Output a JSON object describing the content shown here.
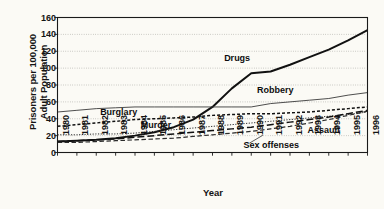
{
  "chart_data": {
    "type": "line",
    "title": "",
    "xlabel": "Year",
    "ylabel_line1": "Prisoners per 100,000",
    "ylabel_line2": "Adult Population",
    "grid": "horizontal-dotted",
    "legend_position": "inline-annotations",
    "xlim": [
      1980,
      1996
    ],
    "ylim": [
      0,
      160
    ],
    "yticks": [
      160,
      140,
      120,
      100,
      80,
      60,
      40,
      20,
      0
    ],
    "categories": [
      1980,
      1981,
      1982,
      1983,
      1984,
      1985,
      1986,
      1987,
      1988,
      1989,
      1990,
      1991,
      1992,
      1993,
      1994,
      1995,
      1996
    ],
    "xticklabels": [
      "1980",
      "1981",
      "1982",
      "1983",
      "1984",
      "1985",
      "1986",
      "1987",
      "1988",
      "1989",
      "1990",
      "1991",
      "1992",
      "1993",
      "1994",
      "1995",
      "1996"
    ],
    "series": [
      {
        "name": "Drugs",
        "style": "solid-thick",
        "color": "#111111",
        "values": [
          13,
          14,
          15,
          17,
          20,
          24,
          30,
          39,
          54,
          76,
          94,
          96,
          104,
          113,
          122,
          133,
          145
        ]
      },
      {
        "name": "Robbery",
        "style": "solid-thin",
        "color": "#3a3a3a",
        "values": [
          48,
          50,
          52,
          53,
          54,
          54,
          54,
          54,
          54,
          54,
          54,
          58,
          60,
          62,
          64,
          68,
          71
        ]
      },
      {
        "name": "Burglary",
        "style": "dashed-short",
        "color": "#111111",
        "values": [
          31,
          33,
          35,
          37,
          39,
          40,
          41,
          42,
          44,
          45,
          46,
          46,
          47,
          48,
          50,
          52,
          54
        ]
      },
      {
        "name": "Murder",
        "style": "dotted-fine",
        "color": "#2a2a2a",
        "values": [
          21,
          21,
          22,
          22,
          23,
          25,
          27,
          29,
          31,
          33,
          35,
          37,
          39,
          41,
          43,
          45,
          48
        ]
      },
      {
        "name": "Assault",
        "style": "dashed-long",
        "color": "#111111",
        "values": [
          13,
          14,
          15,
          16,
          18,
          20,
          22,
          24,
          26,
          28,
          30,
          33,
          36,
          39,
          42,
          46,
          50
        ]
      },
      {
        "name": "Sex offenses",
        "style": "dashed-medium",
        "color": "#2a2a2a",
        "values": [
          12,
          12,
          13,
          14,
          15,
          16,
          17,
          19,
          21,
          23,
          25,
          28,
          31,
          35,
          39,
          44,
          49
        ]
      }
    ],
    "annotations": [
      {
        "text": "Drugs",
        "x": 1988.6,
        "y": 112
      },
      {
        "text": "Robbery",
        "x": 1990.3,
        "y": 74
      },
      {
        "text": "Burglary",
        "x": 1982.2,
        "y": 48
      },
      {
        "text": "Murder",
        "x": 1984.3,
        "y": 32
      },
      {
        "text": "Assault",
        "x": 1992.9,
        "y": 26
      },
      {
        "text": "Sex offenses",
        "x": 1989.6,
        "y": 8
      }
    ]
  }
}
